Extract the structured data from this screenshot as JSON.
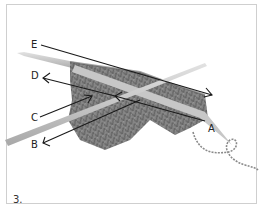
{
  "figure": {
    "step_number": "3.",
    "labels": {
      "A": "A",
      "B": "B",
      "C": "C",
      "D": "D",
      "E": "E"
    },
    "colors": {
      "background": "#ffffff",
      "frame_border": "#cfcfcf",
      "needle": "#b9b9b9",
      "needle_highlight": "#dedede",
      "fabric": "#7a7a7a",
      "fabric_dark": "#5a5a5a",
      "yarn": "#8a8a8a",
      "arrow": "#1a1a1a"
    }
  }
}
